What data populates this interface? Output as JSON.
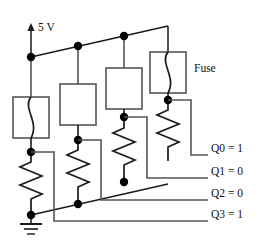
{
  "figure": {
    "kind": "circuit-schematic",
    "supply_label": "5 V",
    "fuse_label": "Fuse",
    "ground_label": ""
  },
  "colors": {
    "wire": "#555555",
    "wire_dark": "#1a1a1a",
    "node": "#000000",
    "text": "#111111",
    "background": "#ffffff"
  },
  "outputs": [
    {
      "id": "q0",
      "label": "Q0 = 1",
      "name": "Q0",
      "value": "1",
      "source_branch": 4
    },
    {
      "id": "q1",
      "label": "Q1 = 0",
      "name": "Q1",
      "value": "0",
      "source_branch": 3
    },
    {
      "id": "q2",
      "label": "Q2 = 0",
      "name": "Q2",
      "value": "0",
      "source_branch": 2
    },
    {
      "id": "q3",
      "label": "Q3 = 1",
      "name": "Q3",
      "value": "1",
      "source_branch": 1
    }
  ],
  "branches": [
    {
      "index": 1,
      "fuse_state": "intact",
      "fuse_has_element": true,
      "output": "Q3 = 1"
    },
    {
      "index": 2,
      "fuse_state": "blown",
      "fuse_has_element": false,
      "output": "Q2 = 0"
    },
    {
      "index": 3,
      "fuse_state": "blown",
      "fuse_has_element": false,
      "output": "Q1 = 0"
    },
    {
      "index": 4,
      "fuse_state": "intact",
      "fuse_has_element": true,
      "output": "Q0 = 1"
    }
  ]
}
